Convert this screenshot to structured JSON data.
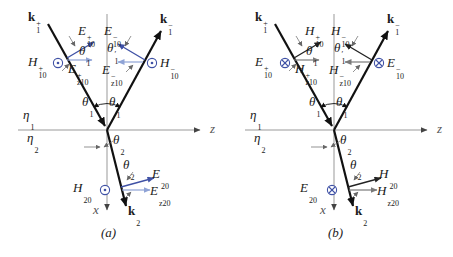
{
  "figure": {
    "colors": {
      "background": "#ffffff",
      "ray_black": "#111111",
      "axis_gray": "#999999",
      "field_blue": "#3f51a5",
      "field_component_light": "#8fa3d6",
      "field_dark": "#222222",
      "field_component_gray": "#7a7a7a",
      "symbol_blue": "#3f51a5",
      "annotation_gray": "#666666"
    },
    "diagrams": [
      {
        "caption": "(a)",
        "axis_z": {
          "b": "z"
        },
        "axis_x": {
          "b": "x"
        },
        "medium_top": {
          "b": "η",
          "sup": "",
          "sub": "1"
        },
        "medium_bottom": {
          "b": "η",
          "sup": "",
          "sub": "2"
        },
        "k_incident": {
          "b": "k",
          "sup": "+",
          "sub": "1"
        },
        "k_reflected": {
          "b": "k",
          "sup": "−",
          "sub": "1"
        },
        "k_transmitted": {
          "b": "k",
          "sup": "",
          "sub": "2"
        },
        "angle_incidence": {
          "b": "θ",
          "sup": "",
          "sub": "1"
        },
        "angle_reflection": {
          "b": "θ",
          "sup": "′",
          "sub": "1"
        },
        "angle_transmission": {
          "b": "θ",
          "sup": "",
          "sub": "2"
        },
        "incident": {
          "normal_symbol": "out-of-page",
          "normal_field": {
            "b": "H",
            "sup": "+",
            "sub": "10"
          },
          "inplane_field": {
            "b": "E",
            "sup": "+",
            "sub": "10"
          },
          "z_component": {
            "b": "E",
            "sup": "+",
            "sub": "z10"
          }
        },
        "reflected": {
          "normal_symbol": "out-of-page",
          "normal_field": {
            "b": "H",
            "sup": "−",
            "sub": "10"
          },
          "inplane_field": {
            "b": "E",
            "sup": "−",
            "sub": "10"
          },
          "z_component": {
            "b": "E",
            "sup": "−",
            "sub": "z10"
          }
        },
        "transmitted": {
          "normal_symbol": "out-of-page",
          "normal_field": {
            "b": "H",
            "sup": "",
            "sub": "20"
          },
          "inplane_field": {
            "b": "E",
            "sup": "",
            "sub": "20"
          },
          "z_component": {
            "b": "E",
            "sup": "",
            "sub": "z20"
          }
        }
      },
      {
        "caption": "(b)",
        "axis_z": {
          "b": "z"
        },
        "axis_x": {
          "b": "x"
        },
        "medium_top": {
          "b": "η",
          "sup": "",
          "sub": "1"
        },
        "medium_bottom": {
          "b": "η",
          "sup": "",
          "sub": "2"
        },
        "k_incident": {
          "b": "k",
          "sup": "+",
          "sub": "1"
        },
        "k_reflected": {
          "b": "k",
          "sup": "−",
          "sub": "1"
        },
        "k_transmitted": {
          "b": "k",
          "sup": "",
          "sub": "2"
        },
        "angle_incidence": {
          "b": "θ",
          "sup": "",
          "sub": "1"
        },
        "angle_reflection": {
          "b": "θ",
          "sup": "′",
          "sub": "1"
        },
        "angle_transmission": {
          "b": "θ",
          "sup": "",
          "sub": "2"
        },
        "incident": {
          "normal_symbol": "into-page",
          "normal_field": {
            "b": "E",
            "sup": "+",
            "sub": "10"
          },
          "inplane_field": {
            "b": "H",
            "sup": "+",
            "sub": "10"
          },
          "z_component": {
            "b": "H",
            "sup": "+",
            "sub": "z10"
          }
        },
        "reflected": {
          "normal_symbol": "into-page",
          "normal_field": {
            "b": "E",
            "sup": "−",
            "sub": "10"
          },
          "inplane_field": {
            "b": "H",
            "sup": "−",
            "sub": "10"
          },
          "z_component": {
            "b": "H",
            "sup": "−",
            "sub": "z10"
          }
        },
        "transmitted": {
          "normal_symbol": "into-page",
          "normal_field": {
            "b": "E",
            "sup": "",
            "sub": "20"
          },
          "inplane_field": {
            "b": "H",
            "sup": "",
            "sub": "20"
          },
          "z_component": {
            "b": "H",
            "sup": "",
            "sub": "z20"
          }
        }
      }
    ]
  }
}
